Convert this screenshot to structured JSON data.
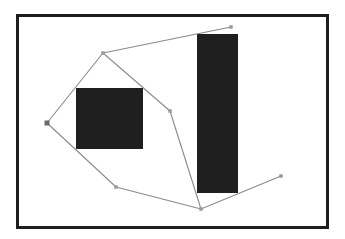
{
  "scene": {
    "description": "Polyline path connecting waypoints around two dark rectangular obstacles inside a bordered frame",
    "colors": {
      "background": "#ffffff",
      "frame": "#1e1e1e",
      "obstacle": "#1f1f1f",
      "path": "#8a8a8a",
      "node": "#9a9a9a",
      "start_node": "#6a6a6a"
    },
    "obstacles": [
      {
        "id": "obstacle-square"
      },
      {
        "id": "obstacle-tall-bar"
      }
    ],
    "nodes": [
      {
        "id": "n-left",
        "role": "start"
      },
      {
        "id": "n-top-left"
      },
      {
        "id": "n-top-right"
      },
      {
        "id": "n-middle"
      },
      {
        "id": "n-bottom-left"
      },
      {
        "id": "n-bottom-center"
      },
      {
        "id": "n-right"
      }
    ],
    "edges": [
      [
        "n-left",
        "n-top-left"
      ],
      [
        "n-top-left",
        "n-top-right"
      ],
      [
        "n-top-left",
        "n-middle"
      ],
      [
        "n-middle",
        "n-bottom-center"
      ],
      [
        "n-left",
        "n-bottom-left"
      ],
      [
        "n-bottom-left",
        "n-bottom-center"
      ],
      [
        "n-bottom-center",
        "n-right"
      ]
    ]
  }
}
